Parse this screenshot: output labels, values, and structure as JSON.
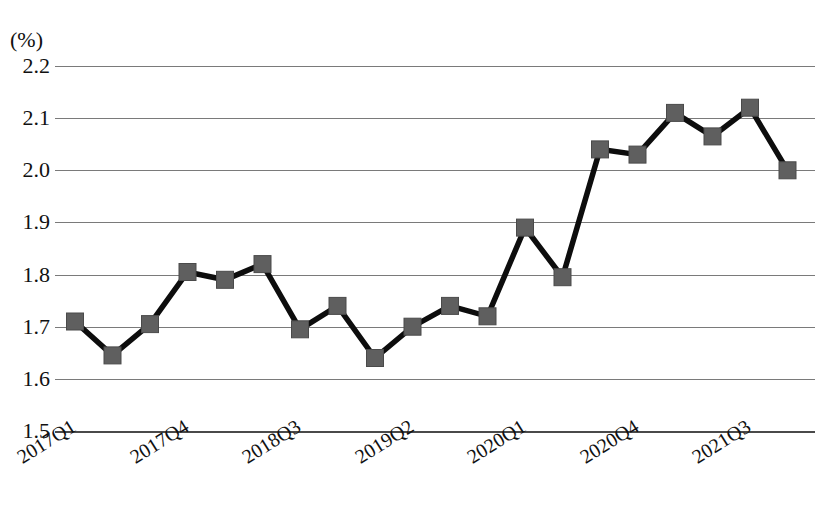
{
  "chart_data": {
    "type": "line",
    "title": "",
    "xlabel": "",
    "ylabel": "(%)",
    "unit_label": "(%)",
    "ylim": [
      1.5,
      2.2
    ],
    "ytick_values": [
      "2.2",
      "2.1",
      "2.0",
      "1.9",
      "1.8",
      "1.7",
      "1.6",
      "1.5"
    ],
    "grid": true,
    "legend": "none",
    "x": [
      "2017Q1",
      "2017Q2",
      "2017Q3",
      "2017Q4",
      "2018Q1",
      "2018Q2",
      "2018Q3",
      "2018Q4",
      "2019Q1",
      "2019Q2",
      "2019Q3",
      "2019Q4",
      "2020Q1",
      "2020Q2",
      "2020Q3",
      "2020Q4",
      "2021Q1",
      "2021Q2",
      "2021Q3",
      "2021Q4"
    ],
    "xtick_labels": [
      "2017Q1",
      "2017Q4",
      "2018Q3",
      "2019Q2",
      "2020Q1",
      "2020Q4",
      "2021Q3"
    ],
    "xtick_indices": [
      0,
      3,
      6,
      9,
      12,
      15,
      18
    ],
    "values": [
      1.71,
      1.645,
      1.705,
      1.805,
      1.79,
      1.82,
      1.695,
      1.74,
      1.64,
      1.7,
      1.74,
      1.72,
      1.89,
      1.795,
      2.04,
      2.03,
      2.11,
      2.065,
      2.12,
      2.0
    ],
    "series_color": "#5f5f5f",
    "line_color": "#0d0d0d",
    "gridline_color": "#7a7a7a",
    "marker_shape": "square"
  },
  "layout": {
    "plot_left": 55,
    "plot_right": 815,
    "y_top_px": 66,
    "y_bottom_px": 431,
    "first_x_px": 75,
    "x_step_px": 37.5,
    "marker_size_px": 17
  }
}
